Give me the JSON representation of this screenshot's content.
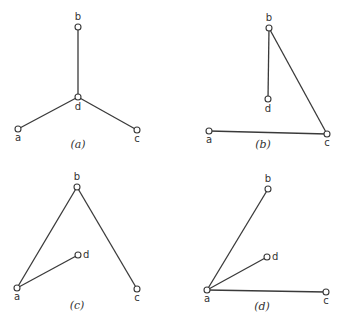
{
  "panels": [
    {
      "id": "a",
      "caption": "(a)",
      "caption_pos": [
        78,
        148
      ],
      "nodes": [
        {
          "id": "b",
          "label": "b",
          "x": 78,
          "y": 27,
          "lx": 78,
          "ly": 20,
          "anchor": "middle"
        },
        {
          "id": "d",
          "label": "d",
          "x": 78,
          "y": 97,
          "lx": 78,
          "ly": 110,
          "anchor": "middle"
        },
        {
          "id": "a",
          "label": "a",
          "x": 18,
          "y": 129,
          "lx": 18,
          "ly": 141,
          "anchor": "middle"
        },
        {
          "id": "c",
          "label": "c",
          "x": 137,
          "y": 130,
          "lx": 137,
          "ly": 142,
          "anchor": "middle"
        }
      ],
      "edges": [
        [
          "b",
          "d"
        ],
        [
          "d",
          "a"
        ],
        [
          "d",
          "c"
        ]
      ]
    },
    {
      "id": "b",
      "caption": "(b)",
      "caption_pos": [
        263,
        148
      ],
      "nodes": [
        {
          "id": "b",
          "label": "b",
          "x": 269,
          "y": 28,
          "lx": 269,
          "ly": 21,
          "anchor": "middle"
        },
        {
          "id": "d",
          "label": "d",
          "x": 268,
          "y": 99,
          "lx": 268,
          "ly": 112,
          "anchor": "middle"
        },
        {
          "id": "a",
          "label": "a",
          "x": 209,
          "y": 131,
          "lx": 209,
          "ly": 143,
          "anchor": "middle"
        },
        {
          "id": "c",
          "label": "c",
          "x": 327,
          "y": 134,
          "lx": 327,
          "ly": 146,
          "anchor": "middle"
        }
      ],
      "edges": [
        [
          "b",
          "d"
        ],
        [
          "b",
          "c"
        ],
        [
          "a",
          "c"
        ]
      ]
    },
    {
      "id": "c",
      "caption": "(c)",
      "caption_pos": [
        77,
        309
      ],
      "nodes": [
        {
          "id": "b",
          "label": "b",
          "x": 77,
          "y": 187,
          "lx": 77,
          "ly": 180,
          "anchor": "middle"
        },
        {
          "id": "d",
          "label": "d",
          "x": 78,
          "y": 255,
          "lx": 83,
          "ly": 258,
          "anchor": "start"
        },
        {
          "id": "a",
          "label": "a",
          "x": 17,
          "y": 288,
          "lx": 17,
          "ly": 300,
          "anchor": "middle"
        },
        {
          "id": "c",
          "label": "c",
          "x": 137,
          "y": 289,
          "lx": 137,
          "ly": 301,
          "anchor": "middle"
        }
      ],
      "edges": [
        [
          "a",
          "b"
        ],
        [
          "b",
          "c"
        ],
        [
          "a",
          "d"
        ]
      ]
    },
    {
      "id": "d",
      "caption": "(d)",
      "caption_pos": [
        262,
        310
      ],
      "nodes": [
        {
          "id": "b",
          "label": "b",
          "x": 268,
          "y": 189,
          "lx": 268,
          "ly": 182,
          "anchor": "middle"
        },
        {
          "id": "d",
          "label": "d",
          "x": 267,
          "y": 257,
          "lx": 272,
          "ly": 260,
          "anchor": "start"
        },
        {
          "id": "a",
          "label": "a",
          "x": 207,
          "y": 290,
          "lx": 207,
          "ly": 302,
          "anchor": "middle"
        },
        {
          "id": "c",
          "label": "c",
          "x": 326,
          "y": 292,
          "lx": 326,
          "ly": 304,
          "anchor": "middle"
        }
      ],
      "edges": [
        [
          "a",
          "b"
        ],
        [
          "a",
          "d"
        ],
        [
          "a",
          "c"
        ]
      ]
    }
  ]
}
